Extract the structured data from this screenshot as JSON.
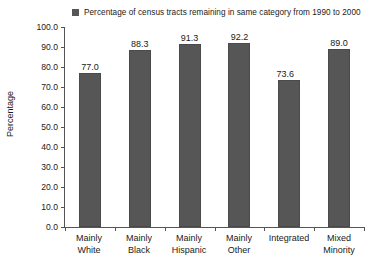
{
  "chart_data": {
    "type": "bar",
    "title": "",
    "xlabel": "",
    "ylabel": "Percentage",
    "ylim": [
      0,
      100
    ],
    "ytick_step": 10,
    "grid": false,
    "legend_position": "top",
    "legend": [
      "Percentage of census tracts remaining in same category from 1990 to 2000"
    ],
    "bar_color": "#565656",
    "categories": [
      "Mainly White",
      "Mainly Black",
      "Mainly Hispanic",
      "Mainly Other",
      "Integrated",
      "Mixed Minority"
    ],
    "values": [
      77.0,
      88.3,
      91.3,
      92.2,
      73.6,
      89.0
    ],
    "value_labels": [
      "77.0",
      "88.3",
      "91.3",
      "92.2",
      "73.6",
      "89.0"
    ],
    "ytick_labels": [
      "100.0",
      "90.0",
      "80.0",
      "70.0",
      "60.0",
      "50.0",
      "40.0",
      "30.0",
      "20.0",
      "10.0",
      "0.0"
    ]
  },
  "legend": {
    "marker": "square-marker",
    "label": "Percentage of census tracts remaining in same category from 1990 to 2000"
  },
  "axes": {
    "y_title": "Percentage"
  },
  "x_categories": [
    {
      "line1": "Mainly",
      "line2": "White"
    },
    {
      "line1": "Mainly",
      "line2": "Black"
    },
    {
      "line1": "Mainly",
      "line2": "Hispanic"
    },
    {
      "line1": "Mainly",
      "line2": "Other"
    },
    {
      "line1": "Integrated",
      "line2": ""
    },
    {
      "line1": "Mixed",
      "line2": "Minority"
    }
  ]
}
